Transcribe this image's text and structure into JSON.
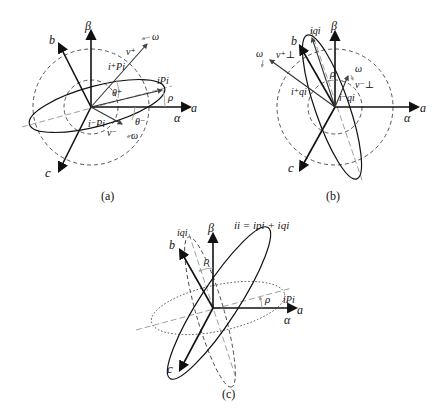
{
  "figure": {
    "panels": [
      {
        "id": "a",
        "caption": "(a)",
        "labels": {
          "beta": "β",
          "b": "b",
          "c": "c",
          "a": "a",
          "alpha": "α",
          "v_plus": "v⁺",
          "v_minus": "v⁻",
          "i_pi_plus": "i⁺Pi",
          "i_pi_minus": "i⁻Pi",
          "i_pi": "iPi",
          "theta_plus": "θ⁺",
          "theta_minus": "θ⁻",
          "rho": "ρ",
          "omega_top": "ω",
          "omega_bottom": "ω"
        }
      },
      {
        "id": "b",
        "caption": "(b)",
        "labels": {
          "beta": "β",
          "b": "b",
          "c": "c",
          "a": "a",
          "alpha": "α",
          "v_perp_plus": "v⁺⊥",
          "v_perp_minus": "v⁻⊥",
          "i_qi_plus": "i⁺qi",
          "i_qi_minus": "i⁻qi",
          "i_qi": "iqi",
          "rho": "ρ",
          "omega_left": "ω",
          "omega_right": "ω"
        }
      },
      {
        "id": "c",
        "caption": "(c)",
        "labels": {
          "beta": "β",
          "b": "b",
          "c": "c",
          "a": "a",
          "alpha": "α",
          "i_qi": "iqi",
          "i_pi": "iPi",
          "equation": "ii = ipi + iqi",
          "rho_top": "ρ",
          "rho_right": "ρ"
        }
      }
    ]
  }
}
